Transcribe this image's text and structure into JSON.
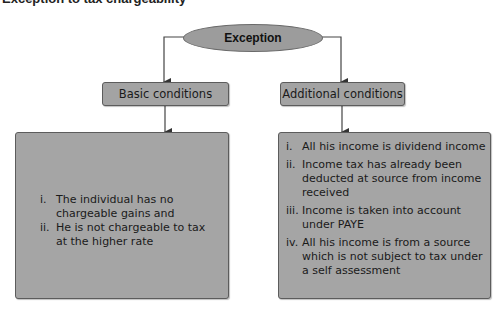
{
  "title": "Exception to tax chargeability",
  "root": {
    "label": "Exception"
  },
  "branches": [
    {
      "label": "Basic conditions",
      "items": [
        {
          "num": "i.",
          "text": "The individual has no chargeable gains and"
        },
        {
          "num": "ii.",
          "text": "He is not chargeable to tax at the higher rate"
        }
      ]
    },
    {
      "label": "Additional conditions",
      "items": [
        {
          "num": "i.",
          "text": "All his income is dividend income"
        },
        {
          "num": "ii.",
          "text": "Income tax has already been deducted at source from income received"
        },
        {
          "num": "iii.",
          "text": "Income is taken into account under PAYE"
        },
        {
          "num": "iv.",
          "text": "All his income is from a source which is not subject to tax under a self assessment"
        }
      ]
    }
  ],
  "colors": {
    "node_fill": "#a3a3a3",
    "node_border": "#5c5c5c",
    "ellipse_fill": "#9c9c9c",
    "connector": "#444444"
  }
}
